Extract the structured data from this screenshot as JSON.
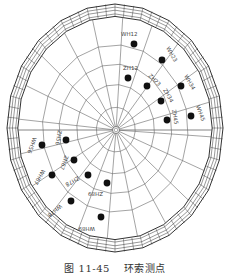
{
  "figure": {
    "caption_number": "图 11-45",
    "caption_title": "环索测点"
  },
  "diagram": {
    "type": "cable-net structure plan with measurement points",
    "center": [
      116,
      130
    ],
    "outer_ellipse": {
      "cx": 115,
      "cy": 128,
      "rx": 108,
      "ry": 124
    },
    "colors": {
      "line": "#555555",
      "ring": "#333333",
      "point": "#111111",
      "background": "#ffffff"
    },
    "points": [
      {
        "id": "WH12",
        "x": 134,
        "y": 44,
        "lx": 121,
        "ly": 36,
        "rot": 0
      },
      {
        "id": "WH23",
        "x": 162,
        "y": 60,
        "lx": 166,
        "ly": 48,
        "rot": 60
      },
      {
        "id": "WH34",
        "x": 181,
        "y": 86,
        "lx": 184,
        "ly": 76,
        "rot": 60
      },
      {
        "id": "WH45",
        "x": 191,
        "y": 116,
        "lx": 196,
        "ly": 106,
        "rot": 70
      },
      {
        "id": "ZH12",
        "x": 128,
        "y": 78,
        "lx": 123,
        "ly": 70,
        "rot": 0
      },
      {
        "id": "ZH23",
        "x": 147,
        "y": 86,
        "lx": 148,
        "ly": 76,
        "rot": 45
      },
      {
        "id": "ZH34",
        "x": 161,
        "y": 101,
        "lx": 163,
        "ly": 90,
        "rot": 60
      },
      {
        "id": "ZH45",
        "x": 167,
        "y": 120,
        "lx": 172,
        "ly": 110,
        "rot": 80
      },
      {
        "id": "WH56",
        "x": 42,
        "y": 145,
        "lx": 33,
        "ly": 137,
        "rot": 110
      },
      {
        "id": "WH67",
        "x": 52,
        "y": 175,
        "lx": 42,
        "ly": 169,
        "rot": 120
      },
      {
        "id": "WH78",
        "x": 71,
        "y": 201,
        "lx": 60,
        "ly": 204,
        "rot": 140
      },
      {
        "id": "WH89",
        "x": 101,
        "y": 217,
        "lx": 95,
        "ly": 227,
        "rot": 180
      },
      {
        "id": "ZH56",
        "x": 66,
        "y": 140,
        "lx": 58,
        "ly": 130,
        "rot": 100
      },
      {
        "id": "ZH67",
        "x": 74,
        "y": 160,
        "lx": 65,
        "ly": 155,
        "rot": 110
      },
      {
        "id": "ZH78",
        "x": 88,
        "y": 175,
        "lx": 78,
        "ly": 176,
        "rot": 150
      },
      {
        "id": "ZH89",
        "x": 107,
        "y": 183,
        "lx": 103,
        "ly": 192,
        "rot": 180
      }
    ]
  }
}
